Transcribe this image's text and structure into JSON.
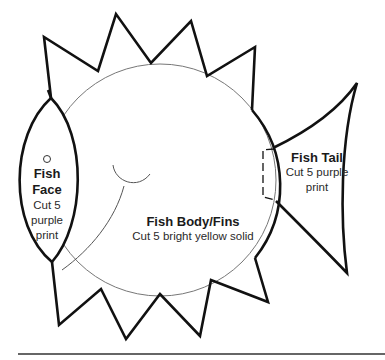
{
  "diagram": {
    "type": "craft-pattern",
    "subject": "fish",
    "pieces": [
      {
        "id": "face",
        "title_lines": [
          "Fish",
          "Face"
        ],
        "instruction_lines": [
          "Cut 5",
          "purple",
          "print"
        ]
      },
      {
        "id": "body",
        "title": "Fish Body/Fins",
        "instruction": "Cut 5 bright yellow solid"
      },
      {
        "id": "tail",
        "title": "Fish Tail",
        "instruction_lines": [
          "Cut 5 purple",
          "print"
        ]
      }
    ],
    "colors": {
      "outline": "#111111",
      "guide_line": "#777777",
      "rule": "#666666",
      "background": "#ffffff"
    }
  }
}
